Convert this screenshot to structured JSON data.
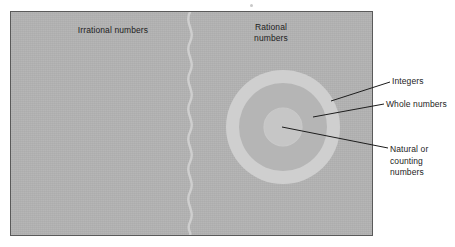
{
  "figure": {
    "panel": {
      "background_color": "#b3b3b3",
      "border_color": "#5a5a5a"
    },
    "regions": [
      {
        "key": "irrational",
        "label": "Irrational numbers",
        "fill_color": "#b3b3b3",
        "description": "left half of panel, separated by a wavy vertical line"
      },
      {
        "key": "rational",
        "label": "Rational\nnumbers",
        "fill_color": "#b3b3b3",
        "description": "right half of panel"
      },
      {
        "key": "integers",
        "label": "Integers",
        "fill_color": "#cdcdcd",
        "shape": "outer ring",
        "radius": 57
      },
      {
        "key": "whole_numbers",
        "label": "Whole numbers",
        "fill_color": "#b5b5b5",
        "shape": "middle disc",
        "radius": 44
      },
      {
        "key": "natural_numbers",
        "label": "Natural or\ncounting\nnumbers",
        "fill_color": "#c6c6c6",
        "shape": "inner disc",
        "radius": 19
      }
    ],
    "labels": {
      "irrational": "Irrational numbers",
      "rational": "Rational\nnumbers",
      "integers": "Integers",
      "whole_numbers": "Whole numbers",
      "natural_numbers": "Natural or\ncounting\nnumbers"
    },
    "divider": {
      "name": "wavy-divider",
      "orientation": "vertical",
      "color": "#d2d2d2"
    },
    "leader_lines": [
      {
        "name": "leader-integers",
        "from": [
          331,
          101
        ],
        "to": [
          390,
          82
        ]
      },
      {
        "name": "leader-whole-numbers",
        "from": [
          313,
          117
        ],
        "to": [
          384,
          104
        ]
      },
      {
        "name": "leader-natural-numbers",
        "from": [
          282,
          127
        ],
        "to": [
          388,
          148
        ]
      }
    ],
    "circle_center": [
      283,
      127
    ],
    "line_color": "#1d1d1d"
  }
}
